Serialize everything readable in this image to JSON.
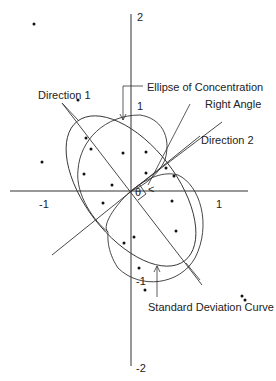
{
  "axes": {
    "y_top": "2",
    "y_pos1": "1",
    "y_neg1": "-1",
    "y_bottom": "-2",
    "x_neg1": "-1",
    "x_pos1": "1"
  },
  "labels": {
    "ellipse": "Ellipse of Concentration",
    "right_angle": "Right Angle",
    "direction1": "Direction 1",
    "direction2": "Direction 2",
    "sd_curve": "Standard Deviation Curve",
    "theta": "θ"
  },
  "colors": {
    "line": "#333333",
    "dot": "#111111",
    "text": "#222222",
    "background": "#ffffff"
  },
  "points": [
    [
      34,
      24
    ],
    [
      78,
      100
    ],
    [
      42,
      162
    ],
    [
      86,
      138
    ],
    [
      91,
      149
    ],
    [
      84,
      174
    ],
    [
      112,
      185
    ],
    [
      103,
      203
    ],
    [
      124,
      243
    ],
    [
      134,
      237
    ],
    [
      146,
      152
    ],
    [
      146,
      173
    ],
    [
      166,
      168
    ],
    [
      174,
      176
    ],
    [
      172,
      201
    ],
    [
      176,
      231
    ],
    [
      139,
      268
    ],
    [
      145,
      290
    ],
    [
      242,
      296
    ],
    [
      245,
      300
    ],
    [
      123,
      153
    ]
  ]
}
